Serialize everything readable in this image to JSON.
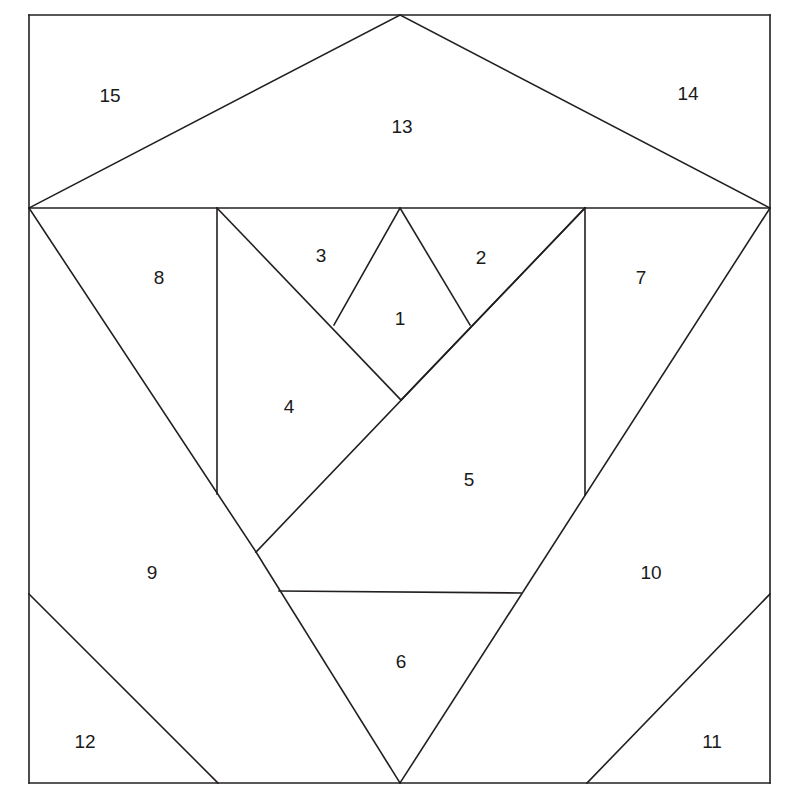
{
  "figure": {
    "kind": "geometric-dissection",
    "background_color": "#ffffff",
    "stroke_color": "#231f20",
    "stroke_width": 1.6,
    "canvas": {
      "width": 790,
      "height": 806
    }
  },
  "frame": {
    "left": 29,
    "top": 15,
    "right": 770,
    "bottom": 783
  },
  "key_points": {
    "apex_top": [
      400,
      15
    ],
    "left_waist": [
      29,
      208
    ],
    "right_waist": [
      770,
      208
    ],
    "diamond_top": [
      400,
      208
    ],
    "diamond_left": [
      334,
      325
    ],
    "diamond_right": [
      470,
      325
    ],
    "diamond_bottom": [
      401,
      400
    ],
    "left_vertical_x": 217,
    "right_vertical_x": 585,
    "left_vertical_bottom": [
      217,
      494
    ],
    "right_vertical_bottom": [
      585,
      495
    ],
    "piece4_bottom": [
      256,
      552
    ],
    "shelf_left": [
      279,
      591
    ],
    "shelf_right": [
      521,
      593
    ],
    "bottom_apex": [
      400,
      783
    ],
    "left_wing_start": [
      29,
      594
    ],
    "left_wing_end": [
      218,
      783
    ],
    "right_wing_start": [
      770,
      594
    ],
    "right_wing_end": [
      587,
      783
    ]
  },
  "segments": [
    {
      "name": "frame-top",
      "from": [
        29,
        15
      ],
      "to": [
        770,
        15
      ]
    },
    {
      "name": "frame-left",
      "from": [
        29,
        15
      ],
      "to": [
        29,
        783
      ]
    },
    {
      "name": "frame-right",
      "from": [
        770,
        15
      ],
      "to": [
        770,
        783
      ]
    },
    {
      "name": "frame-bottom",
      "from": [
        29,
        783
      ],
      "to": [
        770,
        783
      ]
    },
    {
      "name": "roof-left",
      "from": [
        400,
        15
      ],
      "to": [
        29,
        208
      ]
    },
    {
      "name": "roof-right",
      "from": [
        400,
        15
      ],
      "to": [
        770,
        208
      ]
    },
    {
      "name": "waist-line",
      "from": [
        29,
        208
      ],
      "to": [
        770,
        208
      ]
    },
    {
      "name": "left-vertical",
      "from": [
        217,
        208
      ],
      "to": [
        217,
        494
      ]
    },
    {
      "name": "right-vertical",
      "from": [
        585,
        208
      ],
      "to": [
        585,
        495
      ]
    },
    {
      "name": "piece8-diagonal",
      "from": [
        29,
        208
      ],
      "to": [
        256,
        552
      ]
    },
    {
      "name": "piece3-diagonal",
      "from": [
        217,
        208
      ],
      "to": [
        401,
        400
      ]
    },
    {
      "name": "diamond-upper-left",
      "from": [
        400,
        208
      ],
      "to": [
        334,
        325
      ]
    },
    {
      "name": "diamond-upper-right",
      "from": [
        400,
        208
      ],
      "to": [
        470,
        325
      ]
    },
    {
      "name": "piece2-diagonal",
      "from": [
        585,
        208
      ],
      "to": [
        401,
        400
      ]
    },
    {
      "name": "piece4-lower-edge",
      "from": [
        256,
        552
      ],
      "to": [
        585,
        208
      ]
    },
    {
      "name": "piece9-diagonal",
      "from": [
        256,
        552
      ],
      "to": [
        400,
        783
      ]
    },
    {
      "name": "piece10-diagonal",
      "from": [
        770,
        208
      ],
      "to": [
        400,
        783
      ]
    },
    {
      "name": "shelf-horizontal",
      "from": [
        279,
        591
      ],
      "to": [
        521,
        593
      ]
    },
    {
      "name": "left-wing-diagonal",
      "from": [
        29,
        594
      ],
      "to": [
        218,
        783
      ]
    },
    {
      "name": "right-wing-diagonal",
      "from": [
        770,
        594
      ],
      "to": [
        587,
        783
      ]
    }
  ],
  "labels": [
    {
      "id": "piece-1",
      "text": "1",
      "x": 400,
      "y": 318
    },
    {
      "id": "piece-2",
      "text": "2",
      "x": 481,
      "y": 257
    },
    {
      "id": "piece-3",
      "text": "3",
      "x": 321,
      "y": 255
    },
    {
      "id": "piece-4",
      "text": "4",
      "x": 289,
      "y": 406
    },
    {
      "id": "piece-5",
      "text": "5",
      "x": 469,
      "y": 479
    },
    {
      "id": "piece-6",
      "text": "6",
      "x": 401,
      "y": 661
    },
    {
      "id": "piece-7",
      "text": "7",
      "x": 641,
      "y": 277
    },
    {
      "id": "piece-8",
      "text": "8",
      "x": 159,
      "y": 277
    },
    {
      "id": "piece-9",
      "text": "9",
      "x": 152,
      "y": 572
    },
    {
      "id": "piece-10",
      "text": "10",
      "x": 651,
      "y": 572
    },
    {
      "id": "piece-11",
      "text": "11",
      "x": 712,
      "y": 741
    },
    {
      "id": "piece-12",
      "text": "12",
      "x": 85,
      "y": 741
    },
    {
      "id": "piece-13",
      "text": "13",
      "x": 402,
      "y": 126
    },
    {
      "id": "piece-14",
      "text": "14",
      "x": 688,
      "y": 93
    },
    {
      "id": "piece-15",
      "text": "15",
      "x": 110,
      "y": 95
    }
  ],
  "caption": {
    "ghost_text": ""
  }
}
